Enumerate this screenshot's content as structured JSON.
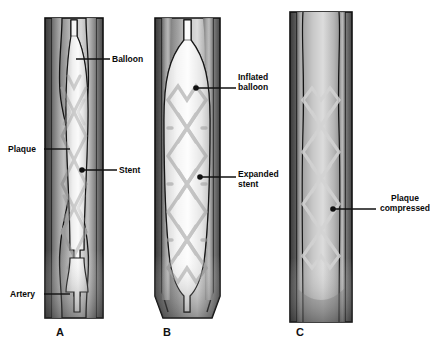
{
  "figure": {
    "background_color": "#ffffff",
    "width": 435,
    "height": 348
  },
  "colors": {
    "outline": "#111111",
    "artery_wall_dark": "#4a4a4a",
    "artery_wall_mid": "#8d8d8d",
    "plaque_gray": "#9a9a9a",
    "lumen_light": "#f2f2f2",
    "stent_gray": "#9c9c9c",
    "label_text": "#0a0a0a",
    "leader_line": "#111111"
  },
  "panels": [
    {
      "id": "A",
      "letter": "A",
      "caption": "Stent and deflated balloon positioned across the plaque",
      "letter_x": 56,
      "letter_y": 326
    },
    {
      "id": "B",
      "letter": "B",
      "caption": "Balloon inflated, stent expanded against artery wall",
      "letter_x": 163,
      "letter_y": 326
    },
    {
      "id": "C",
      "letter": "C",
      "caption": "Balloon removed, stent holds plaque compressed",
      "letter_x": 296,
      "letter_y": 326
    }
  ],
  "labels": [
    {
      "key": "balloon",
      "text": "Balloon",
      "panel": "A",
      "text_x": 112,
      "text_y": 54,
      "align": "left",
      "leader": {
        "type": "line",
        "x1": 110,
        "y1": 59,
        "x2": 76,
        "y2": 59
      },
      "marker": null
    },
    {
      "key": "plaque",
      "text": "Plaque",
      "panel": "A",
      "text_x": 8,
      "text_y": 144,
      "align": "left",
      "leader": {
        "type": "line",
        "x1": 44,
        "y1": 149,
        "x2": 70,
        "y2": 149
      },
      "marker": null
    },
    {
      "key": "stent",
      "text": "Stent",
      "panel": "A",
      "text_x": 119,
      "text_y": 165,
      "align": "left",
      "leader": {
        "type": "line",
        "x1": 117,
        "y1": 170,
        "x2": 82,
        "y2": 170
      },
      "marker": {
        "cx": 82,
        "cy": 170,
        "r": 2.6
      }
    },
    {
      "key": "artery",
      "text": "Artery",
      "panel": "A",
      "text_x": 10,
      "text_y": 289,
      "align": "left",
      "leader": {
        "type": "line",
        "x1": 44,
        "y1": 294,
        "x2": 70,
        "y2": 294
      },
      "marker": null
    },
    {
      "key": "inflated-balloon",
      "text": "Inflated\nballoon",
      "text_line1": "Inflated",
      "text_line2": "balloon",
      "panel": "B",
      "text_x": 238,
      "text_y": 72,
      "align": "left",
      "leader": {
        "type": "line",
        "x1": 236,
        "y1": 88,
        "x2": 196,
        "y2": 88
      },
      "marker": {
        "cx": 196,
        "cy": 88,
        "r": 2.6
      }
    },
    {
      "key": "expanded-stent",
      "text": "Expanded\nstent",
      "text_line1": "Expanded",
      "text_line2": "stent",
      "panel": "B",
      "text_x": 238,
      "text_y": 169,
      "align": "left",
      "leader": {
        "type": "line",
        "x1": 236,
        "y1": 177,
        "x2": 200,
        "y2": 177
      },
      "marker": {
        "cx": 200,
        "cy": 177,
        "r": 2.6
      }
    },
    {
      "key": "plaque-compressed",
      "text": "Plaque\ncompressed",
      "text_line1": "Plaque",
      "text_line2": "compressed",
      "panel": "C",
      "text_x": 378,
      "text_y": 193,
      "align": "left",
      "leader": {
        "type": "line",
        "x1": 376,
        "y1": 209,
        "x2": 333,
        "y2": 209
      },
      "marker": {
        "cx": 333,
        "cy": 209,
        "r": 2.6
      }
    }
  ],
  "diagram_notes": {
    "panel_a_vessel": {
      "x": 45,
      "y": 18,
      "width": 58,
      "height": 300
    },
    "panel_b_vessel": {
      "x": 155,
      "y": 18,
      "width": 65,
      "height": 300
    },
    "panel_c_vessel": {
      "x": 290,
      "y": 12,
      "width": 62,
      "height": 310
    },
    "stent_mesh_rows_a": 7,
    "stent_mesh_rows_b": 6,
    "stent_mesh_rows_c": 7
  }
}
